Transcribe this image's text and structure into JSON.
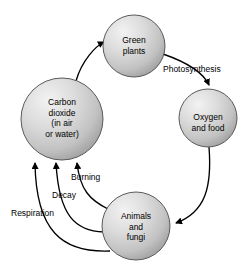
{
  "diagram": {
    "type": "cycle-diagram",
    "background_color": "#ffffff",
    "node_fill_light": "#e8e8e8",
    "node_fill_dark": "#9a9a9a",
    "node_stroke": "#555555",
    "arrow_color": "#000000",
    "nodes": [
      {
        "id": "green-plants",
        "label": "Green\nplants",
        "cx": 134,
        "cy": 46,
        "r": 31
      },
      {
        "id": "oxygen-and-food",
        "label": "Oxygen\nand food",
        "cx": 208,
        "cy": 118,
        "r": 29
      },
      {
        "id": "animals-and-fungi",
        "label": "Animals\nand\nfungi",
        "cx": 136,
        "cy": 226,
        "r": 34
      },
      {
        "id": "carbon-dioxide",
        "label": "Carbon\ndioxide\n(in air\nor water)",
        "cx": 62,
        "cy": 119,
        "r": 41
      }
    ],
    "edges": [
      {
        "id": "co2-to-plants",
        "from": "carbon-dioxide",
        "to": "green-plants",
        "label": ""
      },
      {
        "id": "plants-to-oxygen",
        "from": "green-plants",
        "to": "oxygen-and-food",
        "label": "Photosynthesis"
      },
      {
        "id": "oxygen-to-animals",
        "from": "oxygen-and-food",
        "to": "animals-and-fungi",
        "label": ""
      },
      {
        "id": "animals-burning-to-co2",
        "from": "animals-and-fungi",
        "to": "carbon-dioxide",
        "label": "Burning"
      },
      {
        "id": "animals-decay-to-co2",
        "from": "animals-and-fungi",
        "to": "carbon-dioxide",
        "label": "Decay"
      },
      {
        "id": "animals-respiration-to-co2",
        "from": "animals-and-fungi",
        "to": "carbon-dioxide",
        "label": "Respiration"
      }
    ],
    "labels": {
      "photosynthesis": "Photosynthesis",
      "burning": "Burning",
      "decay": "Decay",
      "respiration": "Respiration"
    }
  }
}
